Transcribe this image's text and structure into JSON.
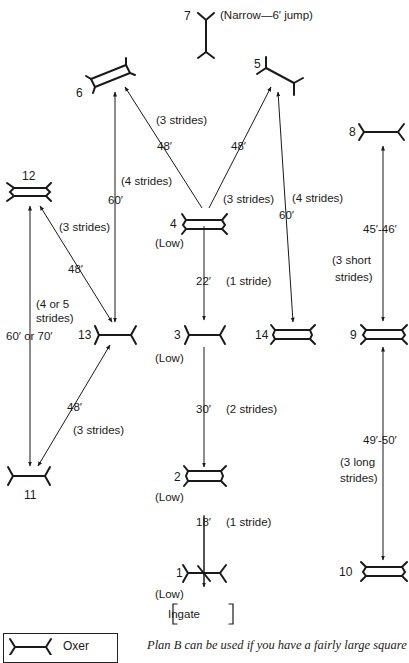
{
  "diagram": {
    "jumps": [
      {
        "id": "1",
        "label": "1",
        "type": "cross-rail",
        "note": "(Low)"
      },
      {
        "id": "2",
        "label": "2",
        "type": "double-rail",
        "note": "(Low)"
      },
      {
        "id": "3",
        "label": "3",
        "type": "oxer",
        "note": "(Low)"
      },
      {
        "id": "4",
        "label": "4",
        "type": "double-rail",
        "note": "(Low)"
      },
      {
        "id": "5",
        "label": "5",
        "type": "oxer-angled"
      },
      {
        "id": "6",
        "label": "6",
        "type": "double-rail-angled"
      },
      {
        "id": "7",
        "label": "7",
        "type": "oxer-vertical",
        "note": "(Narrow—6′ jump)"
      },
      {
        "id": "8",
        "label": "8",
        "type": "oxer"
      },
      {
        "id": "9",
        "label": "9",
        "type": "double-rail"
      },
      {
        "id": "10",
        "label": "10",
        "type": "double-rail"
      },
      {
        "id": "11",
        "label": "11",
        "type": "oxer"
      },
      {
        "id": "12",
        "label": "12",
        "type": "double-rail"
      },
      {
        "id": "13",
        "label": "13",
        "type": "oxer"
      },
      {
        "id": "14",
        "label": "14",
        "type": "double-rail"
      }
    ],
    "distances": [
      {
        "from": "1",
        "to": "2",
        "distance": "18′",
        "strides": "(1 stride)"
      },
      {
        "from": "2",
        "to": "3",
        "distance": "30′",
        "strides": "(2 strides)"
      },
      {
        "from": "3",
        "to": "4",
        "distance": "22′",
        "strides": "(1 stride)"
      },
      {
        "from": "4",
        "to": "6",
        "distance": "48′",
        "strides": "(3 strides)"
      },
      {
        "from": "4",
        "to": "5",
        "distance": "48′",
        "strides": "(3 strides)"
      },
      {
        "from": "6",
        "to": "13",
        "distance": "60′",
        "strides": "(4 strides)"
      },
      {
        "from": "5",
        "to": "14",
        "distance": "60′",
        "strides": "(4 strides)"
      },
      {
        "from": "13",
        "to": "12",
        "distance": "48′",
        "strides": "(3 strides)"
      },
      {
        "from": "12",
        "to": "11",
        "distance": "60′ or 70′",
        "strides_line1": "(4 or 5",
        "strides_line2": "strides)"
      },
      {
        "from": "13",
        "to": "11",
        "distance": "48′",
        "strides": "(3 strides)"
      },
      {
        "from": "8",
        "to": "9",
        "distance": "45′-46′",
        "strides_line1": "(3 short",
        "strides_line2": "strides)"
      },
      {
        "from": "9",
        "to": "10",
        "distance": "49′-50′",
        "strides_line1": "(3 long",
        "strides_line2": "strides)"
      }
    ],
    "ingate": "Ingate"
  },
  "legend": {
    "items": [
      {
        "symbol": "oxer-icon",
        "label": "Oxer"
      }
    ]
  },
  "caption": "Plan B can be used if you have a fairly large square"
}
